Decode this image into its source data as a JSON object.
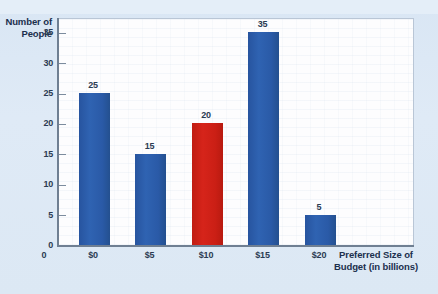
{
  "chart_data": {
    "type": "bar",
    "title": "",
    "xlabel": "Preferred Size of Budget (in billions)",
    "ylabel": "Number of People",
    "categories": [
      "$0",
      "$5",
      "$10",
      "$15",
      "$20"
    ],
    "values": [
      25,
      15,
      20,
      35,
      5
    ],
    "value_labels": [
      "25",
      "15",
      "20",
      "35",
      "5"
    ],
    "bar_colors": [
      "#2a5aa7",
      "#2a5aa7",
      "#cb1f15",
      "#2a5aa7",
      "#2a5aa7"
    ],
    "highlighted_category": "$10",
    "ylim": [
      0,
      37.5
    ],
    "yticks": [
      0,
      5,
      10,
      15,
      20,
      25,
      30,
      35
    ],
    "ytick_labels": [
      "0",
      "5",
      "10",
      "15",
      "20",
      "25",
      "30",
      "35"
    ],
    "grid": false,
    "legend": null
  },
  "axes": {
    "y_title_lines": [
      "Number of",
      "People"
    ],
    "x_title_lines": [
      "Preferred Size of",
      "Budget (in billions)"
    ],
    "origin_label": "0"
  },
  "colors": {
    "background": "#dce8f5",
    "plot_background": "#fdfdfe",
    "bar_blue": "#2a5aa7",
    "bar_red": "#cb1f15",
    "axis": "#6f7f92",
    "text": "#2b3b52"
  }
}
